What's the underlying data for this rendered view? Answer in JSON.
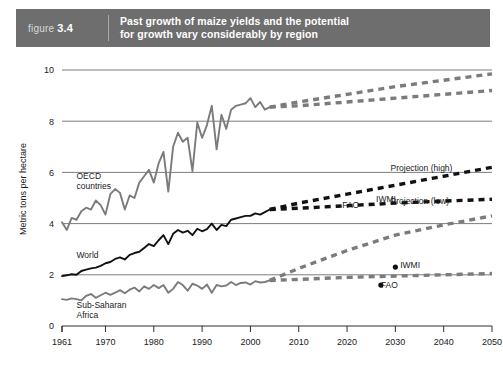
{
  "header": {
    "figure_word": "figure",
    "figure_number": "3.4",
    "title_line1": "Past growth of maize yields and the potential",
    "title_line2": "for growth vary considerably by region",
    "band_color": "#6e6e6e"
  },
  "colors": {
    "dark_series": "#111111",
    "gray_series": "#7b7b7b",
    "gridline": "#6e6e6e",
    "text": "#1a1a1a",
    "background": "#ffffff"
  },
  "chart_data": {
    "type": "line",
    "title": "Past growth of maize yields and the potential for growth vary considerably by region",
    "xlabel": "",
    "ylabel": "Metric tons per hectare",
    "xlim": [
      1961,
      2050
    ],
    "ylim": [
      0,
      10
    ],
    "grid": true,
    "legend_position": "inline-annotations",
    "x_ticks": [
      1961,
      1970,
      1980,
      1990,
      2000,
      2010,
      2020,
      2030,
      2040,
      2050
    ],
    "y_ticks": [
      0,
      2,
      4,
      6,
      8,
      10
    ],
    "annotations": [
      {
        "text": "OECD countries",
        "x": 1964,
        "y": 5.75
      },
      {
        "text": "World",
        "x": 1964,
        "y": 2.65
      },
      {
        "text": "Sub-Saharan Africa",
        "x": 1964,
        "y": 0.72
      },
      {
        "text": "Projection (high)",
        "x": 2029,
        "y": 6.05
      },
      {
        "text": "Projection (low)",
        "x": 2029,
        "y": 4.75
      },
      {
        "text": "FAO",
        "x": 2019,
        "y": 4.6
      },
      {
        "text": "IWMI",
        "x": 2026,
        "y": 4.85
      },
      {
        "text": "IWMI",
        "x": 2031,
        "y": 2.25
      },
      {
        "text": "FAO",
        "x": 2027,
        "y": 1.48
      }
    ],
    "markers": [
      {
        "label": "IWMI",
        "x": 2030,
        "y": 2.3,
        "color": "#111111"
      },
      {
        "label": "FAO",
        "x": 2027,
        "y": 1.6,
        "color": "#111111"
      }
    ],
    "series": [
      {
        "name": "OECD countries",
        "kind": "historical",
        "color": "#7b7b7b",
        "x": [
          1961,
          1962,
          1963,
          1964,
          1965,
          1966,
          1967,
          1968,
          1969,
          1970,
          1971,
          1972,
          1973,
          1974,
          1975,
          1976,
          1977,
          1978,
          1979,
          1980,
          1981,
          1982,
          1983,
          1984,
          1985,
          1986,
          1987,
          1988,
          1989,
          1990,
          1991,
          1992,
          1993,
          1994,
          1995,
          1996,
          1997,
          1998,
          1999,
          2000,
          2001,
          2002,
          2003,
          2004
        ],
        "values": [
          4.05,
          3.75,
          4.22,
          4.15,
          4.48,
          4.62,
          4.55,
          4.9,
          4.72,
          4.35,
          5.15,
          5.35,
          5.2,
          4.55,
          5.1,
          5.0,
          5.6,
          5.85,
          6.1,
          5.6,
          6.35,
          6.8,
          5.25,
          7.0,
          7.55,
          7.2,
          7.35,
          6.05,
          7.95,
          7.35,
          7.85,
          8.6,
          6.9,
          8.25,
          7.7,
          8.45,
          8.6,
          8.65,
          8.7,
          8.9,
          8.55,
          8.75,
          8.45,
          8.55
        ]
      },
      {
        "name": "OECD countries projection (high)",
        "kind": "projection",
        "color": "#7b7b7b",
        "x": [
          2004,
          2010,
          2020,
          2030,
          2040,
          2050
        ],
        "values": [
          8.55,
          8.75,
          9.05,
          9.35,
          9.6,
          9.85
        ]
      },
      {
        "name": "OECD countries projection (low)",
        "kind": "projection",
        "color": "#7b7b7b",
        "x": [
          2004,
          2010,
          2020,
          2030,
          2040,
          2050
        ],
        "values": [
          8.55,
          8.6,
          8.75,
          8.9,
          9.05,
          9.2
        ]
      },
      {
        "name": "World",
        "kind": "historical",
        "color": "#111111",
        "x": [
          1961,
          1962,
          1963,
          1964,
          1965,
          1966,
          1967,
          1968,
          1969,
          1970,
          1971,
          1972,
          1973,
          1974,
          1975,
          1976,
          1977,
          1978,
          1979,
          1980,
          1981,
          1982,
          1983,
          1984,
          1985,
          1986,
          1987,
          1988,
          1989,
          1990,
          1991,
          1992,
          1993,
          1994,
          1995,
          1996,
          1997,
          1998,
          1999,
          2000,
          2001,
          2002,
          2003,
          2004
        ],
        "values": [
          1.95,
          1.98,
          2.02,
          2.0,
          2.15,
          2.2,
          2.25,
          2.28,
          2.35,
          2.45,
          2.5,
          2.62,
          2.68,
          2.6,
          2.78,
          2.85,
          2.9,
          3.05,
          3.2,
          3.12,
          3.35,
          3.55,
          3.2,
          3.6,
          3.75,
          3.65,
          3.72,
          3.55,
          3.8,
          3.7,
          3.78,
          4.0,
          3.75,
          3.95,
          3.9,
          4.15,
          4.2,
          4.25,
          4.3,
          4.3,
          4.4,
          4.35,
          4.45,
          4.55
        ]
      },
      {
        "name": "World projection (high)",
        "kind": "projection",
        "color": "#111111",
        "x": [
          2004,
          2010,
          2020,
          2030,
          2040,
          2050
        ],
        "values": [
          4.55,
          4.8,
          5.15,
          5.5,
          5.85,
          6.2
        ]
      },
      {
        "name": "World projection (low)",
        "kind": "projection",
        "color": "#111111",
        "x": [
          2004,
          2010,
          2020,
          2030,
          2040,
          2050
        ],
        "values": [
          4.55,
          4.6,
          4.7,
          4.8,
          4.88,
          4.95
        ]
      },
      {
        "name": "Sub-Saharan Africa",
        "kind": "historical",
        "color": "#7b7b7b",
        "x": [
          1961,
          1962,
          1963,
          1964,
          1965,
          1966,
          1967,
          1968,
          1969,
          1970,
          1971,
          1972,
          1973,
          1974,
          1975,
          1976,
          1977,
          1978,
          1979,
          1980,
          1981,
          1982,
          1983,
          1984,
          1985,
          1986,
          1987,
          1988,
          1989,
          1990,
          1991,
          1992,
          1993,
          1994,
          1995,
          1996,
          1997,
          1998,
          1999,
          2000,
          2001,
          2002,
          2003,
          2004
        ],
        "values": [
          1.05,
          1.02,
          1.08,
          1.05,
          1.0,
          1.18,
          1.25,
          1.1,
          1.2,
          1.3,
          1.22,
          1.3,
          1.4,
          1.28,
          1.42,
          1.5,
          1.35,
          1.55,
          1.45,
          1.6,
          1.48,
          1.6,
          1.3,
          1.45,
          1.72,
          1.6,
          1.38,
          1.65,
          1.58,
          1.45,
          1.62,
          1.3,
          1.6,
          1.55,
          1.58,
          1.72,
          1.6,
          1.68,
          1.7,
          1.62,
          1.75,
          1.7,
          1.72,
          1.78
        ]
      },
      {
        "name": "Sub-Saharan Africa projection (high)",
        "kind": "projection",
        "color": "#7b7b7b",
        "x": [
          2004,
          2010,
          2020,
          2030,
          2040,
          2050
        ],
        "values": [
          1.78,
          2.25,
          2.95,
          3.55,
          3.95,
          4.3
        ]
      },
      {
        "name": "Sub-Saharan Africa projection (low)",
        "kind": "projection",
        "color": "#7b7b7b",
        "x": [
          2004,
          2010,
          2020,
          2030,
          2040,
          2050
        ],
        "values": [
          1.78,
          1.82,
          1.9,
          1.95,
          2.0,
          2.05
        ]
      }
    ]
  }
}
